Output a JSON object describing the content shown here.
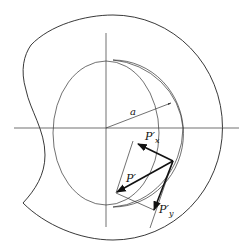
{
  "diagram": {
    "labels": {
      "radius": "a",
      "force_total": "P′",
      "force_x": "P′",
      "force_x_sub": "x",
      "force_y": "P′",
      "force_y_sub": "y"
    },
    "elements": [
      "outer-boundary",
      "horizontal-axis",
      "vertical-axis",
      "inner-circle",
      "offset-circle",
      "radius-arrow",
      "force-vector-P",
      "force-component-Px",
      "force-component-Py",
      "construction-lines"
    ],
    "colors": {
      "line": "#222222",
      "background": "#ffffff"
    }
  }
}
